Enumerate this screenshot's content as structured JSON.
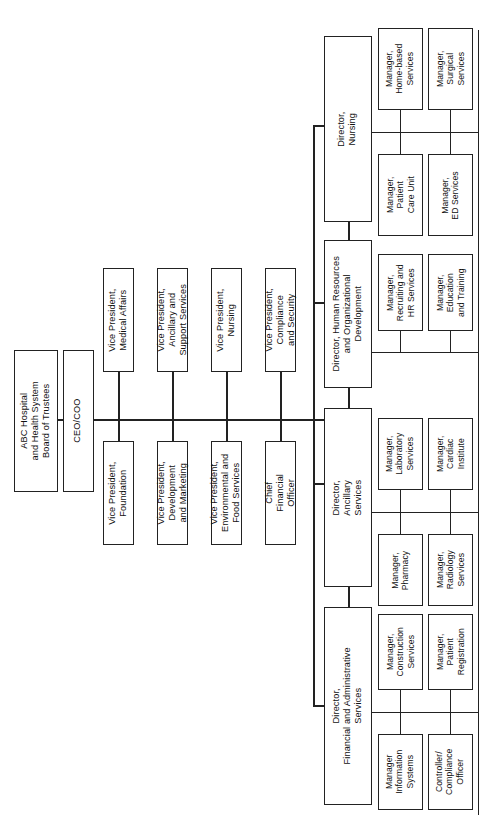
{
  "chart": {
    "orientation": "rotated-90-ccw",
    "type": "org-chart"
  },
  "board": {
    "label": "ABC Hospital\nand Health System\nBoard of Trustees",
    "line1": "ABC Hospital",
    "line2": "and Health System",
    "line3": "Board of Trustees"
  },
  "ceo": {
    "label": "CEO/COO"
  },
  "executives": {
    "upper": [
      {
        "line1": "Vice President,",
        "line2": "Medical Affairs",
        "line3": ""
      },
      {
        "line1": "Vice President,",
        "line2": "Ancillary and",
        "line3": "Support Services"
      },
      {
        "line1": "Vice President,",
        "line2": "Nursing",
        "line3": ""
      },
      {
        "line1": "Vice President,",
        "line2": "Compliance",
        "line3": "and Security"
      }
    ],
    "lower": [
      {
        "line1": "Vice President,",
        "line2": "Foundation",
        "line3": ""
      },
      {
        "line1": "Vice President,",
        "line2": "Development",
        "line3": "and Marketing"
      },
      {
        "line1": "Vice President,",
        "line2": "Environmental and",
        "line3": "Food Services"
      },
      {
        "line1": "Chief",
        "line2": "Financial",
        "line3": "Officer"
      }
    ]
  },
  "directors": [
    {
      "line1": "Director,",
      "line2": "Nursing",
      "line3": ""
    },
    {
      "line1": "Director, Human Resources",
      "line2": "and Organizational",
      "line3": "Development"
    },
    {
      "line1": "Director,",
      "line2": "Ancillary",
      "line3": "Services"
    },
    {
      "line1": "Director,",
      "line2": "Financial and Administrative",
      "line3": "Services"
    }
  ],
  "managers": {
    "nursing": {
      "outer": [
        {
          "line1": "Manager,",
          "line2": "Home-based",
          "line3": "Services"
        },
        {
          "line1": "Manager,",
          "line2": "Surgical",
          "line3": "Services"
        }
      ],
      "inner": [
        {
          "line1": "Manager,",
          "line2": "Patient",
          "line3": "Care Unit"
        },
        {
          "line1": "Manager,",
          "line2": "ED Services",
          "line3": ""
        }
      ]
    },
    "human_resources": {
      "outer": [
        {
          "line1": "Manager,",
          "line2": "Recruiting and",
          "line3": "HR Services"
        },
        {
          "line1": "Manager,",
          "line2": "Education",
          "line3": "and Training"
        }
      ],
      "inner": []
    },
    "ancillary": {
      "outer": [
        {
          "line1": "Manager,",
          "line2": "Laboratory",
          "line3": "Services"
        },
        {
          "line1": "Manager,",
          "line2": "Cardiac",
          "line3": "Institute"
        }
      ],
      "inner": [
        {
          "line1": "Manager,",
          "line2": "Pharmacy",
          "line3": ""
        },
        {
          "line1": "Manager,",
          "line2": "Radiology",
          "line3": "Services"
        }
      ]
    },
    "financial_admin": {
      "outer": [
        {
          "line1": "Manager,",
          "line2": "Construction",
          "line3": "Services"
        },
        {
          "line1": "Manager,",
          "line2": "Patient",
          "line3": "Registration"
        }
      ],
      "inner": [
        {
          "line1": "Manager",
          "line2": "Information",
          "line3": "Systems"
        },
        {
          "line1": "Controller/",
          "line2": "Compliance",
          "line3": "Officer"
        }
      ]
    }
  },
  "colors": {
    "border": "#222222",
    "background": "#ffffff",
    "text": "#111111"
  }
}
